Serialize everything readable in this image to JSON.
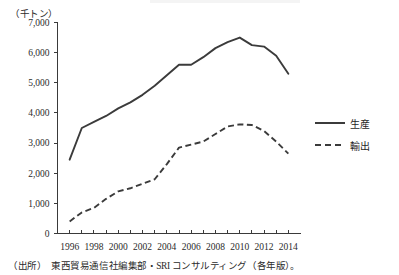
{
  "figure": {
    "unit_label": "（千トン）",
    "source_tag": "（出所）",
    "source_text": "東西貿易通信社編集部・SRI コンサルティング（各年版）。"
  },
  "legend": {
    "items": [
      {
        "label": "生産",
        "style": "solid",
        "name": "legend-production"
      },
      {
        "label": "輸出",
        "style": "dashed",
        "name": "legend-export"
      }
    ]
  },
  "chart_data": {
    "type": "line",
    "title": "",
    "xlabel": "",
    "ylabel": "（千トン）",
    "ylim": [
      0,
      7000
    ],
    "xlim": [
      1995,
      2015
    ],
    "ytick_values": [
      0,
      1000,
      2000,
      3000,
      4000,
      5000,
      6000,
      7000
    ],
    "ytick_labels": [
      "0",
      "1,000",
      "2,000",
      "3,000",
      "4,000",
      "5,000",
      "6,000",
      "7,000"
    ],
    "xtick_values": [
      1996,
      1998,
      2000,
      2002,
      2004,
      2006,
      2008,
      2010,
      2012,
      2014
    ],
    "xtick_labels": [
      "1996",
      "1998",
      "2000",
      "2002",
      "2004",
      "2006",
      "2008",
      "2010",
      "2012",
      "2014"
    ],
    "minor_xticks_every": 1,
    "grid": false,
    "legend_position": "right",
    "x": [
      1996,
      1997,
      1998,
      1999,
      2000,
      2001,
      2002,
      2003,
      2004,
      2005,
      2006,
      2007,
      2008,
      2009,
      2010,
      2011,
      2012,
      2013,
      2014
    ],
    "series": [
      {
        "name": "生産",
        "style": "solid",
        "values": [
          2450,
          3500,
          3700,
          3900,
          4150,
          4350,
          4600,
          4900,
          5250,
          5600,
          5600,
          5850,
          6150,
          6350,
          6500,
          6250,
          6200,
          5900,
          5300
        ]
      },
      {
        "name": "輸出",
        "style": "dashed",
        "values": [
          400,
          700,
          850,
          1150,
          1400,
          1500,
          1650,
          1800,
          2300,
          2850,
          2950,
          3050,
          3300,
          3550,
          3620,
          3600,
          3400,
          3050,
          2650
        ]
      }
    ]
  }
}
